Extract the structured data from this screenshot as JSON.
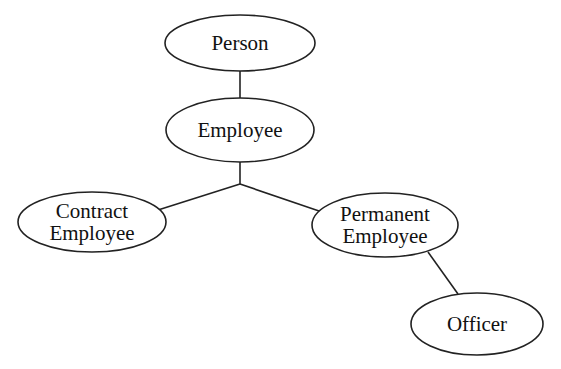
{
  "diagram": {
    "type": "inheritance-hierarchy",
    "colors": {
      "background": "#ffffff",
      "stroke": "#222222",
      "text": "#111111"
    },
    "nodes": [
      {
        "id": "person",
        "lines": [
          "Person"
        ],
        "cx": 240,
        "cy": 43,
        "rx": 75,
        "ry": 28
      },
      {
        "id": "employee",
        "lines": [
          "Employee"
        ],
        "cx": 240,
        "cy": 130,
        "rx": 74,
        "ry": 32
      },
      {
        "id": "contract-employee",
        "lines": [
          "Contract",
          "Employee"
        ],
        "cx": 92,
        "cy": 222,
        "rx": 74,
        "ry": 30
      },
      {
        "id": "permanent-employee",
        "lines": [
          "Permanent",
          "Employee"
        ],
        "cx": 385,
        "cy": 225,
        "rx": 73,
        "ry": 32
      },
      {
        "id": "officer",
        "lines": [
          "Officer"
        ],
        "cx": 477,
        "cy": 324,
        "rx": 66,
        "ry": 31
      }
    ],
    "edges": [
      {
        "from": "person",
        "to": "employee",
        "points": [
          [
            240,
            71
          ],
          [
            240,
            98
          ]
        ]
      },
      {
        "from": "employee",
        "to": "junction",
        "points": [
          [
            240,
            162
          ],
          [
            240,
            184
          ]
        ]
      },
      {
        "from": "junction",
        "to": "contract-employee",
        "points": [
          [
            240,
            184
          ],
          [
            158,
            210
          ]
        ]
      },
      {
        "from": "junction",
        "to": "permanent-employee",
        "points": [
          [
            240,
            184
          ],
          [
            322,
            212
          ]
        ]
      },
      {
        "from": "permanent-employee",
        "to": "officer",
        "points": [
          [
            428,
            252
          ],
          [
            458,
            294
          ]
        ]
      }
    ]
  }
}
